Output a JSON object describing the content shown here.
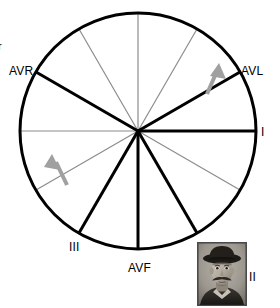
{
  "figure": {
    "type": "diagram"
  },
  "colors": {
    "axis_major": "#000000",
    "axis_minor": "#8c8c8c",
    "circle_stroke": "#000000",
    "arrow": "#a0a0a0",
    "background": "#ffffff",
    "label_text": "#000000",
    "photo_border": "#4a4a4a"
  },
  "circle": {
    "center_x": 138,
    "center_y": 131,
    "radius": 118,
    "stroke_width": 3
  },
  "axes": [
    {
      "name": "lead-I",
      "angle_deg": 0,
      "weight": "thick",
      "color": "#000000",
      "label": "I"
    },
    {
      "name": "lead-aVL",
      "angle_deg": -30,
      "weight": "thick",
      "color": "#000000",
      "label": "AVL"
    },
    {
      "name": "minor-60",
      "angle_deg": -60,
      "weight": "thin",
      "color": "#8c8c8c",
      "label": ""
    },
    {
      "name": "minor-90",
      "angle_deg": -90,
      "weight": "thin",
      "color": "#8c8c8c",
      "label": ""
    },
    {
      "name": "minor-120",
      "angle_deg": -120,
      "weight": "thin",
      "color": "#8c8c8c",
      "label": ""
    },
    {
      "name": "lead-aVR",
      "angle_deg": -150,
      "weight": "thick",
      "color": "#000000",
      "label": "AVR"
    },
    {
      "name": "minor-180",
      "angle_deg": 180,
      "weight": "thin",
      "color": "#8c8c8c",
      "label": ""
    },
    {
      "name": "minor-150",
      "angle_deg": 150,
      "weight": "thin",
      "color": "#8c8c8c",
      "label": ""
    },
    {
      "name": "lead-III",
      "angle_deg": 120,
      "weight": "thick",
      "color": "#000000",
      "label": "III"
    },
    {
      "name": "lead-aVF",
      "angle_deg": 90,
      "weight": "thick",
      "color": "#000000",
      "label": "AVF"
    },
    {
      "name": "lead-II",
      "angle_deg": 60,
      "weight": "thick",
      "color": "#000000",
      "label": "II"
    },
    {
      "name": "minor-30",
      "angle_deg": 30,
      "weight": "thin",
      "color": "#8c8c8c",
      "label": ""
    }
  ],
  "labels": {
    "avr": "AVR",
    "avl": "AVL",
    "lead_i": "I",
    "lead_ii": "II",
    "lead_iii": "III",
    "avf": "AVF",
    "clipped_left": "r"
  },
  "arrows": [
    {
      "name": "arrow-upper-right",
      "on_axis_deg": -30,
      "x1": 207,
      "y1": 94,
      "x2": 219,
      "y2": 66,
      "color": "#a0a0a0",
      "stroke_width": 4
    },
    {
      "name": "arrow-lower-left",
      "on_axis_deg": 150,
      "x1": 67,
      "y1": 185,
      "x2": 53,
      "y2": 156,
      "color": "#a0a0a0",
      "stroke_width": 4
    }
  ],
  "photo": {
    "name": "portrait-inset",
    "description": "vintage black and white portrait of a man with wide-brimmed hat and moustache",
    "x": 197,
    "y": 242,
    "width": 48,
    "height": 62
  }
}
